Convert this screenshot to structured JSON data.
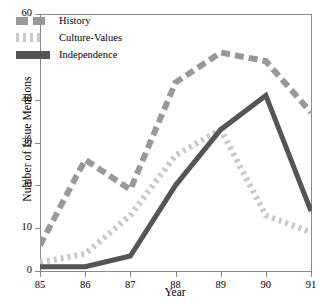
{
  "chart_data": {
    "type": "line",
    "title": "",
    "xlabel": "Year",
    "ylabel": "Number of Issue Mentions",
    "x": [
      "85",
      "86",
      "87",
      "88",
      "89",
      "90",
      "91"
    ],
    "xlim": [
      85,
      91
    ],
    "ylim": [
      0,
      60
    ],
    "yticks": [
      0,
      10,
      20,
      30,
      40,
      50,
      60
    ],
    "xticks": [
      "85",
      "86",
      "87",
      "88",
      "89",
      "90",
      "91"
    ],
    "grid": false,
    "legend_position": "top-left",
    "series": [
      {
        "name": "History",
        "style": "dashed",
        "color": "#999999",
        "values": [
          6,
          26,
          19,
          44,
          51,
          49,
          37
        ]
      },
      {
        "name": "Culture-Values",
        "style": "dotted",
        "color": "#c9c9c9",
        "values": [
          2,
          4,
          13,
          27,
          33,
          13,
          9
        ]
      },
      {
        "name": "Independence",
        "style": "solid",
        "color": "#555555",
        "values": [
          1,
          1,
          3.5,
          20,
          33,
          41,
          14
        ]
      }
    ]
  },
  "axes": {
    "y_title": "Number of Issue Mentions",
    "x_title": "Year",
    "y_tick_labels": [
      "0",
      "10",
      "20",
      "30",
      "40",
      "50",
      "60"
    ],
    "x_tick_labels": [
      "85",
      "86",
      "87",
      "88",
      "89",
      "90",
      "91"
    ]
  },
  "legend": {
    "items": [
      {
        "label": "History",
        "swatch": "dashed-swatch",
        "color": "#999999"
      },
      {
        "label": "Culture-Values",
        "swatch": "dotted-swatch",
        "color": "#c9c9c9"
      },
      {
        "label": "Independence",
        "swatch": "solid-swatch",
        "color": "#555555"
      }
    ]
  }
}
